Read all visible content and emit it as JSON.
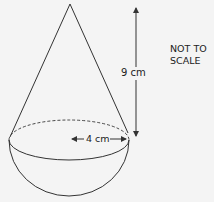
{
  "diagram": {
    "shape": "cone on hemisphere",
    "height_label": "9 cm",
    "radius_label": "4 cm",
    "note_line1": "NOT TO",
    "note_line2": "SCALE",
    "colors": {
      "line": "#333333",
      "background": "#f4f4f4"
    }
  }
}
